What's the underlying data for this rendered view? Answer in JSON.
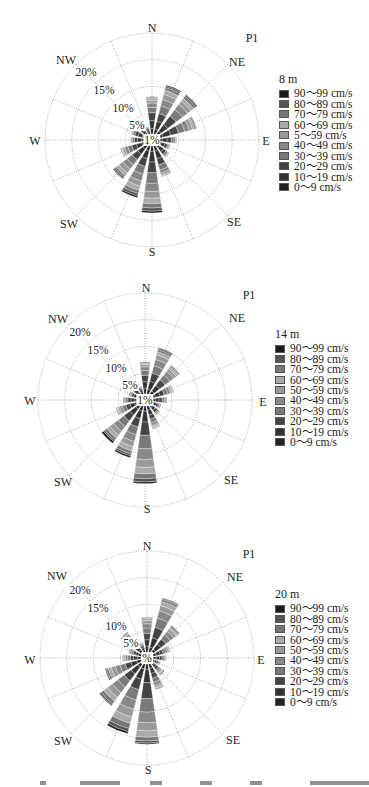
{
  "legend_colors": [
    "#1a1a1a",
    "#555555",
    "#777777",
    "#aaaaaa",
    "#999999",
    "#888888",
    "#7a7a7a",
    "#444444",
    "#333333",
    "#222222"
  ],
  "directions_16": [
    "N",
    "NNE",
    "NE",
    "ENE",
    "E",
    "ESE",
    "SE",
    "SSE",
    "S",
    "SSW",
    "SW",
    "WSW",
    "W",
    "WNW",
    "NW",
    "NNW"
  ],
  "compass_labels": [
    "N",
    "NE",
    "E",
    "SE",
    "S",
    "SW",
    "W",
    "NW"
  ],
  "ring_labels": [
    "5%",
    "10%",
    "15%",
    "20%"
  ],
  "center_label": "1%",
  "panels": [
    {
      "id": "p1-8m",
      "station": "P1",
      "depth_title": "8 m",
      "center_label": "1%",
      "legend": [
        "90～99 cm/s",
        "80～89 cm/s",
        "70～79 cm/s",
        "60～69 cm/s",
        "5～59 cm/s",
        "40～49 cm/s",
        "30～39 cm/s",
        "20～29 cm/s",
        "10～19 cm/s",
        "0～9 cm/s"
      ]
    },
    {
      "id": "p1-14m",
      "station": "P1",
      "depth_title": "14 m",
      "center_label": "1%",
      "legend": [
        "90～99 cm/s",
        "80～89 cm/s",
        "70～79 cm/s",
        "60～69 cm/s",
        "50～59 cm/s",
        "40～49 cm/s",
        "30～39 cm/s",
        "20～29 cm/s",
        "10～19 cm/s",
        "0～9 cm/s"
      ]
    },
    {
      "id": "p1-20m",
      "station": "P1",
      "depth_title": "20 m",
      "center_label": "%",
      "legend": [
        "90～99 cm/s",
        "80～89 cm/s",
        "70～79 cm/s",
        "60～69 cm/s",
        "50～59 cm/s",
        "40～49 cm/s",
        "30～39 cm/s",
        "20～29 cm/s",
        "10～19 cm/s",
        "0～9 cm/s"
      ]
    }
  ],
  "chart_data": [
    {
      "type": "rose",
      "title": "P1",
      "subtitle": "8 m",
      "radial_unit": "%",
      "radial_ticks": [
        1,
        5,
        10,
        15,
        20
      ],
      "rlim": [
        0,
        20
      ],
      "directions": [
        "N",
        "NNE",
        "NE",
        "ENE",
        "E",
        "ESE",
        "SE",
        "SSE",
        "S",
        "SSW",
        "SW",
        "WSW",
        "W",
        "WNW",
        "NW",
        "NNW"
      ],
      "legend": [
        "90～99 cm/s",
        "80～89 cm/s",
        "70～79 cm/s",
        "60～69 cm/s",
        "5～59 cm/s",
        "40～49 cm/s",
        "30～39 cm/s",
        "20～29 cm/s",
        "10～19 cm/s",
        "0～9 cm/s"
      ],
      "totals": [
        7.0,
        9.5,
        9.5,
        7.5,
        3.5,
        2.5,
        3.0,
        6.0,
        12.5,
        10.0,
        8.0,
        5.0,
        3.0,
        3.0,
        2.0,
        1.5
      ],
      "segments_note": "stack order from center outward: 0～9, 10～19, 20～29, 30～39, 40～49, 50～59, 60～69, 70～79, 80～89, 90～99 cm/s",
      "series": [
        {
          "name": "0～9 cm/s",
          "values": [
            1.0,
            1.0,
            1.0,
            1.0,
            0.8,
            0.7,
            0.8,
            1.0,
            1.0,
            1.0,
            1.0,
            0.9,
            0.8,
            0.8,
            0.6,
            0.5
          ]
        },
        {
          "name": "10～19 cm/s",
          "values": [
            1.5,
            1.5,
            1.5,
            1.5,
            0.9,
            0.7,
            0.8,
            1.5,
            2.0,
            1.5,
            1.2,
            1.0,
            0.8,
            0.8,
            0.5,
            0.4
          ]
        },
        {
          "name": "20～29 cm/s",
          "values": [
            1.5,
            1.5,
            2.0,
            1.5,
            0.8,
            0.5,
            0.6,
            1.2,
            2.0,
            1.5,
            1.3,
            0.9,
            0.6,
            0.6,
            0.4,
            0.3
          ]
        },
        {
          "name": "30～39 cm/s",
          "values": [
            1.0,
            1.5,
            1.5,
            1.2,
            0.5,
            0.3,
            0.4,
            1.0,
            2.0,
            1.5,
            1.2,
            0.8,
            0.4,
            0.4,
            0.3,
            0.2
          ]
        },
        {
          "name": "40～49 cm/s",
          "values": [
            0.8,
            1.2,
            1.2,
            0.9,
            0.3,
            0.2,
            0.2,
            0.6,
            1.5,
            1.3,
            1.0,
            0.6,
            0.2,
            0.2,
            0.2,
            0.1
          ]
        },
        {
          "name": "50～59 cm/s",
          "values": [
            0.5,
            1.0,
            0.8,
            0.6,
            0.2,
            0.1,
            0.1,
            0.4,
            1.3,
            1.0,
            0.9,
            0.4,
            0.1,
            0.1,
            0.0,
            0.0
          ]
        },
        {
          "name": "60～69 cm/s",
          "values": [
            0.4,
            0.8,
            0.6,
            0.4,
            0.0,
            0.0,
            0.1,
            0.2,
            1.0,
            0.8,
            0.6,
            0.2,
            0.1,
            0.1,
            0.0,
            0.0
          ]
        },
        {
          "name": "70～79 cm/s",
          "values": [
            0.2,
            0.5,
            0.5,
            0.3,
            0.0,
            0.0,
            0.0,
            0.1,
            0.8,
            0.6,
            0.4,
            0.1,
            0.0,
            0.0,
            0.0,
            0.0
          ]
        },
        {
          "name": "80～89 cm/s",
          "values": [
            0.1,
            0.3,
            0.3,
            0.1,
            0.0,
            0.0,
            0.0,
            0.0,
            0.6,
            0.5,
            0.3,
            0.1,
            0.0,
            0.0,
            0.0,
            0.0
          ]
        },
        {
          "name": "90～99 cm/s",
          "values": [
            0.0,
            0.2,
            0.1,
            0.0,
            0.0,
            0.0,
            0.0,
            0.0,
            0.3,
            0.3,
            0.1,
            0.0,
            0.0,
            0.0,
            0.0,
            0.0
          ]
        }
      ]
    },
    {
      "type": "rose",
      "title": "P1",
      "subtitle": "14 m",
      "radial_unit": "%",
      "radial_ticks": [
        1,
        5,
        10,
        15,
        20
      ],
      "rlim": [
        0,
        20
      ],
      "directions": [
        "N",
        "NNE",
        "NE",
        "ENE",
        "E",
        "ESE",
        "SE",
        "SSE",
        "S",
        "SSW",
        "SW",
        "WSW",
        "W",
        "WNW",
        "NW",
        "NNW"
      ],
      "legend": [
        "90～99 cm/s",
        "80～89 cm/s",
        "70～79 cm/s",
        "60～69 cm/s",
        "50～59 cm/s",
        "40～49 cm/s",
        "30～39 cm/s",
        "20～29 cm/s",
        "10～19 cm/s",
        "0～9 cm/s"
      ],
      "totals": [
        6.0,
        9.0,
        7.0,
        4.5,
        3.0,
        2.0,
        2.5,
        4.5,
        14.5,
        10.0,
        9.0,
        4.5,
        3.0,
        2.0,
        3.0,
        1.5
      ],
      "series": [
        {
          "name": "0～9 cm/s",
          "values": [
            1.0,
            1.0,
            1.0,
            0.9,
            0.8,
            0.6,
            0.7,
            0.9,
            1.0,
            1.0,
            1.0,
            0.9,
            0.8,
            0.6,
            0.7,
            0.5
          ]
        },
        {
          "name": "10～19 cm/s",
          "values": [
            1.3,
            1.5,
            1.3,
            0.9,
            0.7,
            0.5,
            0.6,
            0.9,
            2.0,
            1.5,
            1.4,
            0.9,
            0.7,
            0.5,
            0.7,
            0.4
          ]
        },
        {
          "name": "20～29 cm/s",
          "values": [
            1.2,
            1.6,
            1.3,
            0.8,
            0.6,
            0.4,
            0.5,
            0.8,
            2.5,
            1.6,
            1.4,
            0.8,
            0.6,
            0.4,
            0.6,
            0.3
          ]
        },
        {
          "name": "30～39 cm/s",
          "values": [
            0.9,
            1.4,
            1.1,
            0.7,
            0.4,
            0.3,
            0.3,
            0.7,
            2.5,
            1.5,
            1.3,
            0.7,
            0.4,
            0.3,
            0.4,
            0.2
          ]
        },
        {
          "name": "40～49 cm/s",
          "values": [
            0.7,
            1.2,
            0.9,
            0.5,
            0.3,
            0.2,
            0.2,
            0.5,
            2.0,
            1.3,
            1.1,
            0.5,
            0.3,
            0.2,
            0.3,
            0.1
          ]
        },
        {
          "name": "50～59 cm/s",
          "values": [
            0.4,
            0.9,
            0.6,
            0.3,
            0.2,
            0.0,
            0.1,
            0.3,
            1.5,
            1.0,
            0.9,
            0.3,
            0.2,
            0.0,
            0.2,
            0.0
          ]
        },
        {
          "name": "60～69 cm/s",
          "values": [
            0.3,
            0.6,
            0.4,
            0.2,
            0.0,
            0.0,
            0.1,
            0.2,
            1.2,
            0.8,
            0.7,
            0.2,
            0.0,
            0.0,
            0.1,
            0.0
          ]
        },
        {
          "name": "70～79 cm/s",
          "values": [
            0.2,
            0.4,
            0.2,
            0.1,
            0.0,
            0.0,
            0.0,
            0.1,
            0.9,
            0.6,
            0.5,
            0.1,
            0.0,
            0.0,
            0.0,
            0.0
          ]
        },
        {
          "name": "80～89 cm/s",
          "values": [
            0.0,
            0.3,
            0.1,
            0.1,
            0.0,
            0.0,
            0.0,
            0.1,
            0.6,
            0.4,
            0.3,
            0.1,
            0.0,
            0.0,
            0.0,
            0.0
          ]
        },
        {
          "name": "90～99 cm/s",
          "values": [
            0.0,
            0.1,
            0.1,
            0.0,
            0.0,
            0.0,
            0.0,
            0.0,
            0.3,
            0.3,
            0.4,
            0.0,
            0.0,
            0.0,
            0.0,
            0.0
          ]
        }
      ]
    },
    {
      "type": "rose",
      "title": "P1",
      "subtitle": "20 m",
      "radial_unit": "%",
      "radial_ticks": [
        1,
        5,
        10,
        15,
        20
      ],
      "rlim": [
        0,
        20
      ],
      "directions": [
        "N",
        "NNE",
        "NE",
        "ENE",
        "E",
        "ESE",
        "SE",
        "SSE",
        "S",
        "SSW",
        "SW",
        "WSW",
        "W",
        "WNW",
        "NW",
        "NNW"
      ],
      "legend": [
        "90～99 cm/s",
        "80～89 cm/s",
        "70～79 cm/s",
        "60～69 cm/s",
        "50～59 cm/s",
        "40～49 cm/s",
        "30～39 cm/s",
        "20～29 cm/s",
        "10～19 cm/s",
        "0～9 cm/s"
      ],
      "totals": [
        6.5,
        10.5,
        6.5,
        3.5,
        2.5,
        1.5,
        2.5,
        5.0,
        15.0,
        13.5,
        10.0,
        7.0,
        3.5,
        2.5,
        5.0,
        2.0
      ],
      "series": [
        {
          "name": "0～9 cm/s",
          "values": [
            1.0,
            1.0,
            0.9,
            0.7,
            0.6,
            0.4,
            0.6,
            0.9,
            1.0,
            1.0,
            1.0,
            0.9,
            0.7,
            0.6,
            0.8,
            0.5
          ]
        },
        {
          "name": "10～19 cm/s",
          "values": [
            1.3,
            1.8,
            1.2,
            0.7,
            0.6,
            0.4,
            0.5,
            1.0,
            2.5,
            2.0,
            1.6,
            1.1,
            0.7,
            0.5,
            0.9,
            0.4
          ]
        },
        {
          "name": "20～29 cm/s",
          "values": [
            1.2,
            2.0,
            1.2,
            0.6,
            0.5,
            0.3,
            0.5,
            0.9,
            3.0,
            2.0,
            1.6,
            1.1,
            0.6,
            0.5,
            0.9,
            0.4
          ]
        },
        {
          "name": "30～39 cm/s",
          "values": [
            1.0,
            1.8,
            1.0,
            0.5,
            0.4,
            0.2,
            0.4,
            0.8,
            2.5,
            2.0,
            1.5,
            1.0,
            0.5,
            0.4,
            0.8,
            0.3
          ]
        },
        {
          "name": "40～49 cm/s",
          "values": [
            0.8,
            1.4,
            0.8,
            0.4,
            0.2,
            0.2,
            0.3,
            0.6,
            2.0,
            1.8,
            1.3,
            0.9,
            0.4,
            0.3,
            0.6,
            0.2
          ]
        },
        {
          "name": "50～59 cm/s",
          "values": [
            0.6,
            1.0,
            0.6,
            0.3,
            0.2,
            0.0,
            0.2,
            0.4,
            1.5,
            1.5,
            1.1,
            0.8,
            0.3,
            0.2,
            0.5,
            0.1
          ]
        },
        {
          "name": "60～69 cm/s",
          "values": [
            0.4,
            0.8,
            0.4,
            0.2,
            0.0,
            0.0,
            0.1,
            0.2,
            1.2,
            1.2,
            0.9,
            0.6,
            0.2,
            0.0,
            0.3,
            0.1
          ]
        },
        {
          "name": "70～79 cm/s",
          "values": [
            0.2,
            0.4,
            0.3,
            0.1,
            0.0,
            0.0,
            0.1,
            0.2,
            0.7,
            1.0,
            0.6,
            0.4,
            0.1,
            0.0,
            0.2,
            0.0
          ]
        },
        {
          "name": "80～89 cm/s",
          "values": [
            0.0,
            0.2,
            0.1,
            0.0,
            0.0,
            0.0,
            0.1,
            0.0,
            0.4,
            0.6,
            0.3,
            0.2,
            0.0,
            0.0,
            0.0,
            0.0
          ]
        },
        {
          "name": "90～99 cm/s",
          "values": [
            0.0,
            0.1,
            0.0,
            0.0,
            0.0,
            0.0,
            0.1,
            0.0,
            0.2,
            0.4,
            0.1,
            0.0,
            0.0,
            0.0,
            0.0,
            0.0
          ]
        }
      ]
    }
  ]
}
